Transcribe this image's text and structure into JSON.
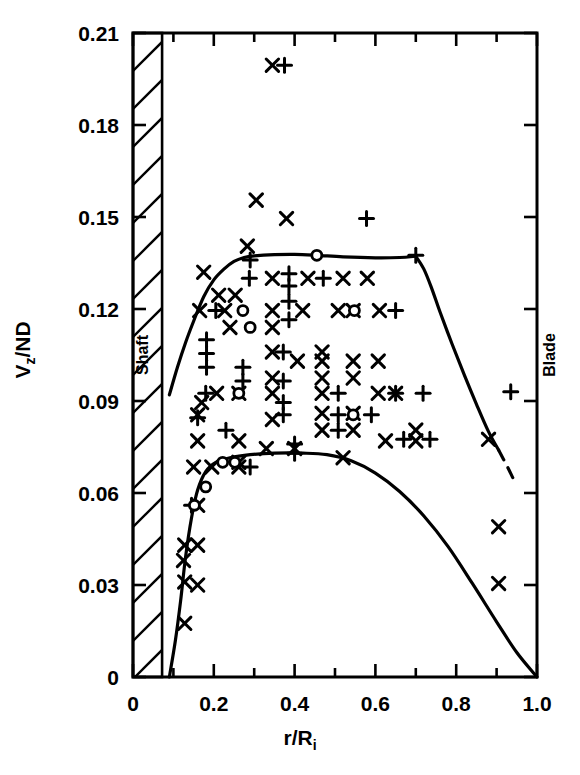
{
  "chart_data": {
    "type": "scatter",
    "title": "",
    "xlabel": "r/R_i",
    "xlabel_base": "r/R",
    "xlabel_sub": "i",
    "ylabel": "V_z/ND",
    "ylabel_base1": "V",
    "ylabel_sub": "z",
    "ylabel_base2": "/ND",
    "xlim": [
      0,
      1.0
    ],
    "ylim": [
      0,
      0.21
    ],
    "x_ticks_major": [
      0,
      0.2,
      0.4,
      0.6,
      0.8,
      1.0
    ],
    "x_tick_labels": [
      "0",
      "0.2",
      "0.4",
      "0.6",
      "0.8",
      "1.0"
    ],
    "x_ticks_minor": [
      0.1,
      0.3,
      0.5,
      0.7,
      0.9
    ],
    "y_ticks_major": [
      0,
      0.03,
      0.06,
      0.09,
      0.12,
      0.15,
      0.18,
      0.21
    ],
    "y_tick_labels": [
      "0",
      "0.03",
      "0.06",
      "0.09",
      "0.12",
      "0.15",
      "0.18",
      "0.21"
    ],
    "grid": false,
    "legend": null,
    "annotations": [
      {
        "name": "shaft",
        "text": "Shaft",
        "x": 0.038,
        "y": 0.105,
        "rotation": -90
      },
      {
        "name": "blade",
        "text": "Blade",
        "x": 1.045,
        "y": 0.105,
        "rotation": -90
      }
    ],
    "hatched_region": {
      "name": "shaft-band",
      "x_start": 0.0,
      "x_end": 0.072,
      "y_start": 0.0,
      "y_end": 0.21
    },
    "series": [
      {
        "name": "cross-markers",
        "symbol": "x",
        "points": [
          [
            0.345,
            0.1995
          ],
          [
            0.305,
            0.1555
          ],
          [
            0.38,
            0.1495
          ],
          [
            0.283,
            0.1405
          ],
          [
            0.175,
            0.132
          ],
          [
            0.345,
            0.13
          ],
          [
            0.433,
            0.13
          ],
          [
            0.52,
            0.13
          ],
          [
            0.58,
            0.13
          ],
          [
            0.212,
            0.1245
          ],
          [
            0.253,
            0.1245
          ],
          [
            0.165,
            0.1195
          ],
          [
            0.227,
            0.1195
          ],
          [
            0.345,
            0.1195
          ],
          [
            0.42,
            0.1195
          ],
          [
            0.508,
            0.1195
          ],
          [
            0.545,
            0.1195
          ],
          [
            0.61,
            0.1195
          ],
          [
            0.24,
            0.114
          ],
          [
            0.345,
            0.114
          ],
          [
            0.468,
            0.106
          ],
          [
            0.345,
            0.106
          ],
          [
            0.407,
            0.103
          ],
          [
            0.468,
            0.103
          ],
          [
            0.545,
            0.103
          ],
          [
            0.607,
            0.103
          ],
          [
            0.345,
            0.0975
          ],
          [
            0.468,
            0.0975
          ],
          [
            0.545,
            0.0975
          ],
          [
            0.207,
            0.0925
          ],
          [
            0.262,
            0.0925
          ],
          [
            0.345,
            0.0925
          ],
          [
            0.468,
            0.0925
          ],
          [
            0.607,
            0.0925
          ],
          [
            0.65,
            0.0925
          ],
          [
            0.17,
            0.0895
          ],
          [
            0.468,
            0.086
          ],
          [
            0.545,
            0.086
          ],
          [
            0.16,
            0.0855
          ],
          [
            0.345,
            0.084
          ],
          [
            0.468,
            0.0805
          ],
          [
            0.545,
            0.0805
          ],
          [
            0.7,
            0.0805
          ],
          [
            0.16,
            0.077
          ],
          [
            0.262,
            0.077
          ],
          [
            0.625,
            0.077
          ],
          [
            0.7,
            0.077
          ],
          [
            0.88,
            0.0775
          ],
          [
            0.33,
            0.0745
          ],
          [
            0.4,
            0.0745
          ],
          [
            0.262,
            0.07
          ],
          [
            0.52,
            0.0715
          ],
          [
            0.195,
            0.0685
          ],
          [
            0.262,
            0.0685
          ],
          [
            0.15,
            0.0685
          ],
          [
            0.16,
            0.056
          ],
          [
            0.128,
            0.043
          ],
          [
            0.16,
            0.043
          ],
          [
            0.125,
            0.038
          ],
          [
            0.128,
            0.031
          ],
          [
            0.16,
            0.03
          ],
          [
            0.128,
            0.0175
          ],
          [
            0.905,
            0.049
          ],
          [
            0.905,
            0.0305
          ]
        ]
      },
      {
        "name": "plus-markers",
        "symbol": "+",
        "points": [
          [
            0.375,
            0.1995
          ],
          [
            0.578,
            0.1495
          ],
          [
            0.29,
            0.136
          ],
          [
            0.288,
            0.13
          ],
          [
            0.386,
            0.1315
          ],
          [
            0.471,
            0.13
          ],
          [
            0.386,
            0.1275
          ],
          [
            0.205,
            0.1195
          ],
          [
            0.386,
            0.1225
          ],
          [
            0.386,
            0.1165
          ],
          [
            0.65,
            0.1195
          ],
          [
            0.182,
            0.11
          ],
          [
            0.182,
            0.1055
          ],
          [
            0.372,
            0.106
          ],
          [
            0.182,
            0.101
          ],
          [
            0.272,
            0.101
          ],
          [
            0.272,
            0.0965
          ],
          [
            0.372,
            0.0965
          ],
          [
            0.18,
            0.0925
          ],
          [
            0.508,
            0.0925
          ],
          [
            0.65,
            0.0925
          ],
          [
            0.718,
            0.0925
          ],
          [
            0.372,
            0.0895
          ],
          [
            0.372,
            0.0855
          ],
          [
            0.508,
            0.0855
          ],
          [
            0.59,
            0.0855
          ],
          [
            0.23,
            0.0805
          ],
          [
            0.508,
            0.0805
          ],
          [
            0.4,
            0.076
          ],
          [
            0.67,
            0.0775
          ],
          [
            0.735,
            0.0775
          ],
          [
            0.16,
            0.0845
          ],
          [
            0.4,
            0.073
          ],
          [
            0.29,
            0.0685
          ],
          [
            0.145,
            0.056
          ],
          [
            0.935,
            0.093
          ],
          [
            0.7,
            0.1375
          ]
        ]
      },
      {
        "name": "circle-markers",
        "symbol": "o",
        "points": [
          [
            0.455,
            0.1375
          ],
          [
            0.272,
            0.1195
          ],
          [
            0.548,
            0.1195
          ],
          [
            0.29,
            0.114
          ],
          [
            0.545,
            0.0855
          ],
          [
            0.262,
            0.0925
          ],
          [
            0.222,
            0.07
          ],
          [
            0.252,
            0.07
          ],
          [
            0.18,
            0.062
          ],
          [
            0.152,
            0.056
          ]
        ]
      }
    ],
    "curves": [
      {
        "name": "upper-boundary-curve",
        "style": "solid",
        "points": [
          [
            0.09,
            0.092
          ],
          [
            0.11,
            0.101
          ],
          [
            0.13,
            0.109
          ],
          [
            0.15,
            0.116
          ],
          [
            0.175,
            0.124
          ],
          [
            0.2,
            0.1295
          ],
          [
            0.225,
            0.133
          ],
          [
            0.25,
            0.1355
          ],
          [
            0.275,
            0.1368
          ],
          [
            0.3,
            0.1373
          ],
          [
            0.35,
            0.1377
          ],
          [
            0.4,
            0.1378
          ],
          [
            0.455,
            0.1375
          ],
          [
            0.52,
            0.137
          ],
          [
            0.6,
            0.1367
          ],
          [
            0.66,
            0.1368
          ],
          [
            0.7,
            0.1372
          ]
        ]
      },
      {
        "name": "upper-boundary-descent",
        "style": "solid",
        "points": [
          [
            0.7,
            0.1372
          ],
          [
            0.72,
            0.133
          ],
          [
            0.74,
            0.1265
          ],
          [
            0.76,
            0.119
          ],
          [
            0.79,
            0.1085
          ],
          [
            0.82,
            0.0985
          ],
          [
            0.85,
            0.089
          ],
          [
            0.88,
            0.08
          ],
          [
            0.905,
            0.074
          ]
        ]
      },
      {
        "name": "upper-boundary-dashed-tail",
        "style": "dashed",
        "points": [
          [
            0.905,
            0.074
          ],
          [
            0.925,
            0.069
          ],
          [
            0.94,
            0.065
          ]
        ]
      },
      {
        "name": "lower-boundary-curve",
        "style": "solid",
        "points": [
          [
            0.09,
            0.0
          ],
          [
            0.105,
            0.012
          ],
          [
            0.118,
            0.025
          ],
          [
            0.13,
            0.039
          ],
          [
            0.145,
            0.052
          ],
          [
            0.16,
            0.061
          ],
          [
            0.18,
            0.067
          ],
          [
            0.205,
            0.07
          ],
          [
            0.24,
            0.0715
          ],
          [
            0.29,
            0.0725
          ],
          [
            0.35,
            0.073
          ],
          [
            0.42,
            0.073
          ],
          [
            0.48,
            0.0725
          ],
          [
            0.54,
            0.0705
          ],
          [
            0.6,
            0.0665
          ],
          [
            0.66,
            0.0605
          ],
          [
            0.72,
            0.0525
          ],
          [
            0.78,
            0.0425
          ],
          [
            0.84,
            0.0305
          ],
          [
            0.9,
            0.018
          ],
          [
            0.95,
            0.008
          ],
          [
            1.0,
            0.0
          ]
        ]
      }
    ]
  },
  "figure": {
    "background": "#ffffff",
    "ink_color": "#000000"
  }
}
